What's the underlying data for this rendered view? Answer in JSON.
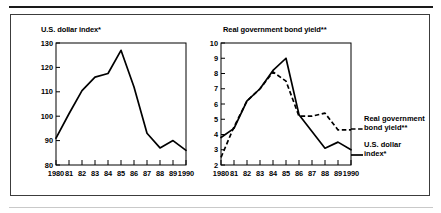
{
  "figure": {
    "panels_count": 2,
    "separator_top": "thick-rule",
    "separator_bottom": "thin-rule"
  },
  "chart_data": [
    {
      "type": "line",
      "panel": "left",
      "title": "U.S. dollar index*",
      "xlabel": "",
      "ylabel": "",
      "xlim": [
        1980,
        1990
      ],
      "ylim": [
        80,
        130
      ],
      "grid": false,
      "legend_position": "none",
      "x": [
        1980,
        1981,
        1982,
        1983,
        1984,
        1985,
        1986,
        1987,
        1988,
        1989,
        1990
      ],
      "xtick_labels": [
        "1980",
        "81",
        "82",
        "83",
        "84",
        "85",
        "86",
        "87",
        "88",
        "89",
        "1990"
      ],
      "ytick_labels": [
        "80",
        "90",
        "100",
        "110",
        "120",
        "130"
      ],
      "ytick_values": [
        80,
        90,
        100,
        110,
        120,
        130
      ],
      "series": [
        {
          "name": "U.S. dollar index*",
          "style": "solid",
          "color": "#000000",
          "values": [
            91,
            101,
            110.5,
            116,
            117.5,
            127,
            112,
            93,
            87,
            90,
            86
          ]
        }
      ]
    },
    {
      "type": "line",
      "panel": "right",
      "title": "Real government bond yield**",
      "xlabel": "",
      "ylabel": "",
      "xlim": [
        1980,
        1990
      ],
      "ylim": [
        2,
        10
      ],
      "grid": false,
      "legend_position": "right",
      "x": [
        1980,
        1981,
        1982,
        1983,
        1984,
        1985,
        1986,
        1987,
        1988,
        1989,
        1990
      ],
      "xtick_labels": [
        "1980",
        "81",
        "82",
        "83",
        "84",
        "85",
        "86",
        "87",
        "88",
        "89",
        "1990"
      ],
      "ytick_labels": [
        "2",
        "3",
        "4",
        "5",
        "6",
        "7",
        "8",
        "9",
        "10"
      ],
      "ytick_values": [
        2,
        3,
        4,
        5,
        6,
        7,
        8,
        9,
        10
      ],
      "series": [
        {
          "name": "U.S. dollar index*",
          "style": "solid",
          "color": "#000000",
          "values": [
            3.8,
            4.4,
            6.2,
            7.0,
            8.2,
            9.0,
            5.3,
            4.2,
            3.1,
            3.5,
            3.0
          ]
        },
        {
          "name": "Real government bond yield**",
          "style": "dashed",
          "color": "#000000",
          "values": [
            2.5,
            4.5,
            6.2,
            7.0,
            8.1,
            7.5,
            5.2,
            5.2,
            5.4,
            4.3,
            4.3
          ]
        }
      ],
      "legend_entries": [
        {
          "label_line1": "Real government",
          "label_line2": "bond yield**",
          "style": "dashed"
        },
        {
          "label_line1": "U.S. dollar",
          "label_line2": "index*",
          "style": "solid"
        }
      ]
    }
  ]
}
